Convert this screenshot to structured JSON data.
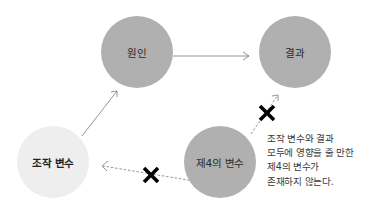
{
  "diagram": {
    "nodes": [
      {
        "id": "cause",
        "label": "원인",
        "cx": 137,
        "cy": 52,
        "r": 36,
        "fill": "#b0b0b0"
      },
      {
        "id": "effect",
        "label": "결과",
        "cx": 295,
        "cy": 52,
        "r": 36,
        "fill": "#b0b0b0"
      },
      {
        "id": "manipulated",
        "label": "조작 변수",
        "cx": 53,
        "cy": 162,
        "r": 36,
        "fill": "#eeeeee"
      },
      {
        "id": "third",
        "label": "제4의 변수",
        "cx": 220,
        "cy": 162,
        "r": 36,
        "fill": "#b0b0b0"
      }
    ],
    "edges": [
      {
        "from": "manipulated",
        "to": "cause",
        "style": "solid",
        "blocked": false
      },
      {
        "from": "cause",
        "to": "effect",
        "style": "solid",
        "blocked": false
      },
      {
        "from": "third",
        "to": "effect",
        "style": "dashed",
        "blocked": true
      },
      {
        "from": "third",
        "to": "manipulated",
        "style": "dashed",
        "blocked": true
      }
    ],
    "note_lines": [
      "조작 변수와 결과",
      "모두에 영향을 줄 만한",
      "제4의 변수가",
      "존재하지 않는다."
    ],
    "colors": {
      "node_dark": "#b0b0b0",
      "node_light": "#eeeeee",
      "arrow": "#7a7a7a",
      "blocked_mark": "#000000"
    }
  }
}
